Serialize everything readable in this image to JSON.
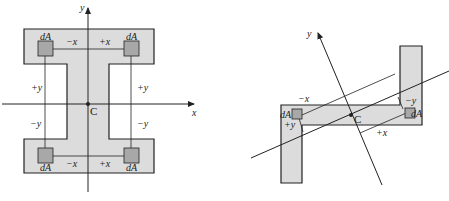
{
  "figures": [
    {
      "name": "symmetric-i-section",
      "centroid_label": "C",
      "axes": {
        "x": "x",
        "y": "y"
      },
      "element_label": "dA",
      "labels": {
        "top_neg_x": "−x",
        "top_pos_x": "+x",
        "bot_neg_x": "−x",
        "bot_pos_x": "+x",
        "left_pos_y": "+y",
        "right_pos_y": "+y",
        "left_neg_y": "−y",
        "right_neg_y": "−y"
      }
    },
    {
      "name": "z-section",
      "centroid_label": "C",
      "axes": {
        "x": "x",
        "y": "y"
      },
      "element_label": "dA",
      "labels": {
        "neg_x": "−x",
        "pos_x": "+x",
        "pos_y": "+y",
        "neg_y": "−y"
      }
    }
  ],
  "colors": {
    "fill": "#dcdcdc",
    "element": "#a8a8a8",
    "stroke": "#222222"
  }
}
